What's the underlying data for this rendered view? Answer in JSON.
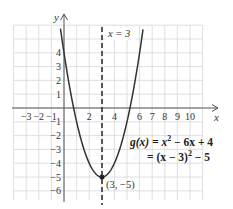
{
  "chart_data": {
    "type": "line",
    "title": "",
    "xlabel": "x",
    "ylabel": "y",
    "xlim": [
      -4,
      11
    ],
    "ylim": [
      -7,
      6
    ],
    "grid": true,
    "x_ticks": [
      -3,
      -2,
      -1,
      2,
      4,
      6,
      7,
      8,
      9,
      10
    ],
    "x_tick_labels": [
      "−3",
      "−2",
      "−1",
      "2",
      "4",
      "6",
      "7",
      "8",
      "9",
      "10"
    ],
    "y_ticks": [
      4,
      3,
      2,
      1,
      -1,
      -2,
      -3,
      -4,
      -5,
      -6
    ],
    "y_tick_labels": [
      "4",
      "3",
      "2",
      "1",
      "−1",
      "−2",
      "−3",
      "−4",
      "−5",
      "−6"
    ],
    "series": [
      {
        "name": "g(x) = x^2 − 6x + 4",
        "function": "x^2 - 6x + 4",
        "x": [
          -0.3,
          0,
          1,
          2,
          3,
          4,
          5,
          6,
          6.3
        ],
        "values": [
          5.89,
          4,
          -1,
          -4,
          -5,
          -4,
          -1,
          4,
          5.89
        ]
      }
    ],
    "annotations": [
      {
        "type": "vertical-dashed-line",
        "x": 3,
        "label": "x = 3"
      },
      {
        "type": "point",
        "x": 3,
        "y": -5,
        "label": "(3, −5)"
      },
      {
        "type": "equation",
        "line1": "g(x) = x² − 6x + 4",
        "line2": "= (x − 3)² − 5"
      }
    ]
  },
  "labels": {
    "x_axis": "x",
    "y_axis": "y",
    "axis_of_symmetry": "x = 3",
    "vertex": "(3, −5)",
    "equation_line1_prefix": "g(x) = x",
    "equation_line1_exp": "2",
    "equation_line1_suffix": " − 6x + 4",
    "equation_line2_prefix": "= (x − 3)",
    "equation_line2_exp": "2",
    "equation_line2_suffix": " − 5"
  },
  "colors": {
    "grid": "#d8d8d8",
    "axis": "#555555",
    "curve": "#333333",
    "dashed": "#333333"
  }
}
